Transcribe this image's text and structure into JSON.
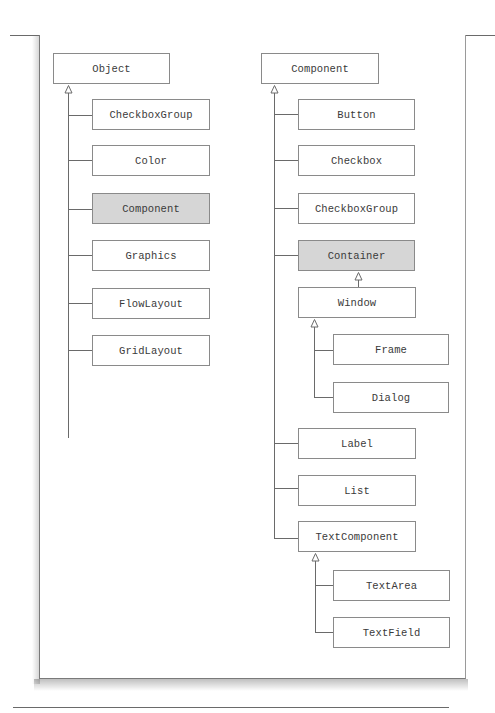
{
  "diagram": {
    "type": "class-hierarchy",
    "left_tree": {
      "root": {
        "label": "Object",
        "shaded": false
      },
      "children": [
        {
          "label": "CheckboxGroup",
          "shaded": false
        },
        {
          "label": "Color",
          "shaded": false
        },
        {
          "label": "Component",
          "shaded": true
        },
        {
          "label": "Graphics",
          "shaded": false
        },
        {
          "label": "FlowLayout",
          "shaded": false
        },
        {
          "label": "GridLayout",
          "shaded": false
        }
      ]
    },
    "right_tree": {
      "root": {
        "label": "Component",
        "shaded": false
      },
      "children": [
        {
          "label": "Button",
          "shaded": false
        },
        {
          "label": "Checkbox",
          "shaded": false
        },
        {
          "label": "CheckboxGroup",
          "shaded": false
        },
        {
          "label": "Container",
          "shaded": true,
          "children": [
            {
              "label": "Window",
              "shaded": false,
              "children": [
                {
                  "label": "Frame",
                  "shaded": false
                },
                {
                  "label": "Dialog",
                  "shaded": false
                }
              ]
            }
          ]
        },
        {
          "label": "Label",
          "shaded": false
        },
        {
          "label": "List",
          "shaded": false
        },
        {
          "label": "TextComponent",
          "shaded": false,
          "children": [
            {
              "label": "TextArea",
              "shaded": false
            },
            {
              "label": "TextField",
              "shaded": false
            }
          ]
        }
      ]
    },
    "colors": {
      "line": "#6a6a6a",
      "box_border": "#8a8a8a",
      "shaded_fill": "#d6d6d6",
      "text": "#3a3a3a"
    }
  }
}
